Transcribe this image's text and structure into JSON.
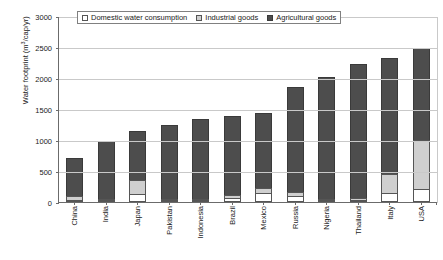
{
  "chart_data": {
    "type": "bar",
    "stacked": true,
    "title": "",
    "xlabel": "",
    "ylabel": "Water footprint (m3/cap/yr)",
    "ylabel_parts": {
      "main": "Water footprint (m",
      "sup": "3",
      "tail": "/cap/yr)"
    },
    "ylim": [
      0,
      3000
    ],
    "yticks": [
      0,
      500,
      1000,
      1500,
      2000,
      2500,
      3000
    ],
    "grid": true,
    "legend_position": "top-inside",
    "categories": [
      "China",
      "India",
      "Japan",
      "Pakistan",
      "Indonesia",
      "Brazil",
      "Mexico",
      "Russia",
      "Nigeria",
      "Thailand",
      "Italy",
      "USA"
    ],
    "series": [
      {
        "name": "Domestic water consumption",
        "color": "#ffffff",
        "values": [
          25,
          30,
          135,
          20,
          20,
          60,
          140,
          100,
          15,
          30,
          140,
          210
        ]
      },
      {
        "name": "Industrial goods",
        "color": "#cfcfcf",
        "values": [
          60,
          20,
          225,
          10,
          10,
          60,
          90,
          65,
          5,
          35,
          310,
          790
        ]
      },
      {
        "name": "Agricultural goods",
        "color": "#4d4d4d",
        "values": [
          620,
          930,
          790,
          1185,
          1285,
          1260,
          1205,
          1685,
          1960,
          2155,
          1870,
          1480
        ]
      }
    ],
    "totals": [
      705,
      980,
      1150,
      1215,
      1315,
      1380,
      1435,
      1850,
      1980,
      2220,
      2320,
      2480
    ]
  },
  "legend": {
    "items": [
      {
        "label": "Domestic water consumption",
        "key": "dom"
      },
      {
        "label": "Industrial goods",
        "key": "ind"
      },
      {
        "label": "Agricultural goods",
        "key": "agr"
      }
    ]
  },
  "colors": {
    "domestic": "#ffffff",
    "industrial": "#cfcfcf",
    "agricultural": "#4d4d4d",
    "axis": "#6b6b6b",
    "grid": "#c9c9c9",
    "background": "#ffffff"
  }
}
